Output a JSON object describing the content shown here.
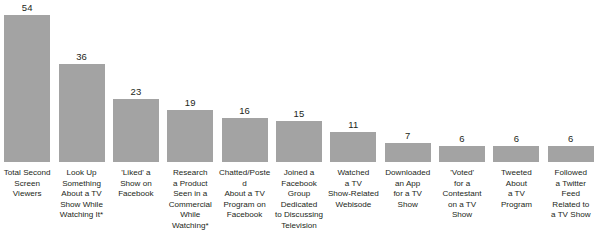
{
  "chart_data": {
    "type": "bar",
    "title": "",
    "subtitle": "",
    "xlabel": "",
    "ylabel": "",
    "ylim": [
      0,
      54
    ],
    "grid": false,
    "legend": null,
    "orientation": "vertical",
    "bar_color": "#a3a3a3",
    "value_label_color": "#231f20",
    "categories": [
      "Total Second Screen Viewers",
      "Look Up Something About a TV Show While Watching It*",
      "'Liked' a Show on Facebook",
      "Research a Product Seen in a Commercial While Watching*",
      "Chatted/Posted About a TV Program on Facebook",
      "Joined a Facebook Group Dedicated to Discussing Television",
      "Watched a TV Show-Related Webisode",
      "Downloaded an App for a TV Show",
      "'Voted' for a Contestant on a TV Show",
      "Tweeted About a TV Program",
      "Followed a Twitter Feed Related to a TV Show"
    ],
    "values": [
      54,
      36,
      23,
      19,
      16,
      15,
      11,
      7,
      6,
      6,
      6
    ],
    "value_labels": [
      "54",
      "36",
      "23",
      "19",
      "16",
      "15",
      "11",
      "7",
      "6",
      "6",
      "6"
    ]
  },
  "bars": [
    {
      "label": "Total Second\nScreen\nViewers",
      "value_label": "54",
      "value": 54
    },
    {
      "label": "Look Up\nSomething\nAbout a TV\nShow While\nWatching It*",
      "value_label": "36",
      "value": 36
    },
    {
      "label": "'Liked' a\nShow on\nFacebook",
      "value_label": "23",
      "value": 23
    },
    {
      "label": "Research\na Product\nSeen in a\nCommercial\nWhile\nWatching*",
      "value_label": "19",
      "value": 19
    },
    {
      "label": "Chatted/Posted\nAbout a TV\nProgram on\nFacebook",
      "value_label": "16",
      "value": 16
    },
    {
      "label": "Joined a\nFacebook\nGroup\nDedicated\nto Discussing\nTelevision",
      "value_label": "15",
      "value": 15
    },
    {
      "label": "Watched\na TV\nShow-Related\nWebisode",
      "value_label": "11",
      "value": 11
    },
    {
      "label": "Downloaded\nan App\nfor a TV\nShow",
      "value_label": "7",
      "value": 7
    },
    {
      "label": "'Voted'\nfor a\nContestant\non a TV\nShow",
      "value_label": "6",
      "value": 6
    },
    {
      "label": "Tweeted\nAbout\na TV\nProgram",
      "value_label": "6",
      "value": 6
    },
    {
      "label": "Followed\na Twitter\nFeed\nRelated to\na TV Show",
      "value_label": "6",
      "value": 6
    }
  ]
}
